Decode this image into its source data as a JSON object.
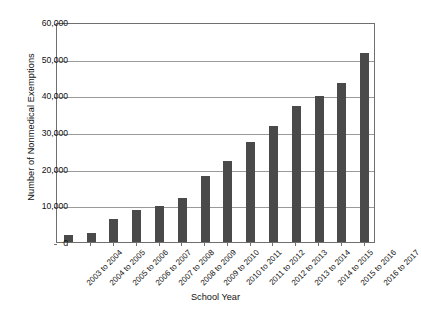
{
  "chart_data": {
    "type": "bar",
    "title": "",
    "xlabel": "School Year",
    "ylabel": "Number of Nonmedical Exemptions",
    "ylim": [
      0,
      60000
    ],
    "ytick_labels": [
      "0",
      "10,000",
      "20,000",
      "30,000",
      "40,000",
      "50,000",
      "60,000"
    ],
    "ytick_values": [
      0,
      10000,
      20000,
      30000,
      40000,
      50000,
      60000
    ],
    "grid": true,
    "legend": "none",
    "bar_color": "#4a4a4a",
    "categories": [
      "2003 to 2004",
      "2004 to 2005",
      "2005 to 2006",
      "2006 to 2007",
      "2007 to 2008",
      "2008 to 2009",
      "2009 to 2010",
      "2010 to 2011",
      "2011 to 2012",
      "2012 to 2013",
      "2013 to 2014",
      "2014 to 2015",
      "2015 to 2016",
      "2016 to 2017"
    ],
    "values": [
      1900,
      2400,
      6400,
      8700,
      9700,
      12100,
      18000,
      22200,
      27200,
      31700,
      37200,
      39900,
      43300,
      51500
    ]
  }
}
